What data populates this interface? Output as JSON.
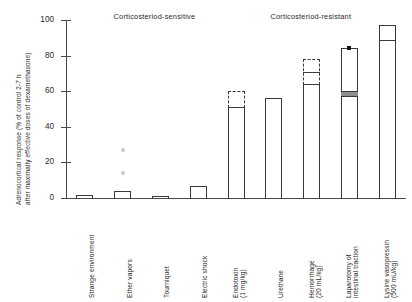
{
  "chart_data": {
    "type": "bar",
    "title": "",
    "xlabel": "",
    "ylabel": "Adrenocortical response (% of control 2-7 h after maximally effective doses of dexamethasone)",
    "ylabel_line1": "Adrenocortical response (% of control 2-7 h",
    "ylabel_line2": "after maximally effective doses of dexamethasone)",
    "ylim": [
      0,
      100
    ],
    "yticks": [
      0,
      20,
      40,
      60,
      80,
      100
    ],
    "ytick_labels": [
      "0",
      "20",
      "40",
      "60",
      "80",
      "100"
    ],
    "grid": false,
    "legend": "none",
    "group_headers": [
      {
        "label": "Corticosteriod-sensitive",
        "center_pct": 26
      },
      {
        "label": "Corticosteriod-resistant",
        "center_pct": 72
      }
    ],
    "categories": [
      "Strange environment",
      "Ether vapors",
      "Tourniquet",
      "Electric shock",
      "Endotoxin (1 mg/kg)",
      "Urethane",
      "Hemorrhage (20 mL/kg)",
      "Laparotomy of intestinal traction",
      "Lysine vasopressin (500 mU/kg)"
    ],
    "category_labels": [
      {
        "line1": "Strange environment",
        "line2": ""
      },
      {
        "line1": "Ether vapors",
        "line2": ""
      },
      {
        "line1": "Tourniquet",
        "line2": ""
      },
      {
        "line1": "Electric shock",
        "line2": ""
      },
      {
        "line1": "Endotoxin",
        "line2": "(1 mg/kg)"
      },
      {
        "line1": "Urethane",
        "line2": ""
      },
      {
        "line1": "Hemorrhage",
        "line2": "(20 mL/kg)"
      },
      {
        "line1": "Laparotomy of",
        "line2": "intestinal traction"
      },
      {
        "line1": "Lysine vasopressin",
        "line2": "(500 mU/kg)"
      }
    ],
    "values": [
      1.5,
      4,
      1,
      7,
      51,
      56,
      64,
      58,
      89
    ],
    "upper_range": [
      null,
      null,
      null,
      null,
      60,
      null,
      78,
      84,
      97
    ],
    "bars": [
      {
        "category": "Strange environment",
        "value": 1.5,
        "upper": null,
        "cap": false,
        "dividers": [],
        "band": null,
        "marker": null
      },
      {
        "category": "Ether vapors",
        "value": 4,
        "upper": null,
        "cap": false,
        "dividers": [],
        "band": null,
        "marker": null
      },
      {
        "category": "Tourniquet",
        "value": 1,
        "upper": null,
        "cap": false,
        "dividers": [],
        "band": null,
        "marker": null
      },
      {
        "category": "Electric shock",
        "value": 7,
        "upper": null,
        "cap": false,
        "dividers": [],
        "band": null,
        "marker": null
      },
      {
        "category": "Endotoxin (1 mg/kg)",
        "value": 51,
        "upper": 60,
        "cap": true,
        "dividers": [],
        "band": null,
        "marker": null
      },
      {
        "category": "Urethane",
        "value": 56,
        "upper": null,
        "cap": false,
        "dividers": [],
        "band": null,
        "marker": null
      },
      {
        "category": "Hemorrhage (20 mL/kg)",
        "value": 64,
        "upper": 78,
        "cap": true,
        "dividers": [
          71
        ],
        "band": null,
        "marker": null
      },
      {
        "category": "Laparotomy of intestinal traction",
        "value": 84,
        "upper": 84,
        "cap": true,
        "dividers": [],
        "band": {
          "low": 57,
          "high": 60
        },
        "marker": 84
      },
      {
        "category": "Lysine vasopressin (500 mU/kg)",
        "value": 97,
        "upper": null,
        "cap": false,
        "dividers": [
          89
        ],
        "band": null,
        "marker": null
      }
    ],
    "scatter_points": [
      {
        "category": "Ether vapors",
        "value": 27
      },
      {
        "category": "Ether vapors",
        "value": 14
      }
    ],
    "colors": {
      "bar_outline": "#3a3a3a",
      "axis": "#4a4a4a",
      "text": "#2a2a2a",
      "scatter": "#c9c9c9",
      "band_fill": "#8e8e8e",
      "marker": "#111111",
      "background": "#ffffff"
    }
  }
}
